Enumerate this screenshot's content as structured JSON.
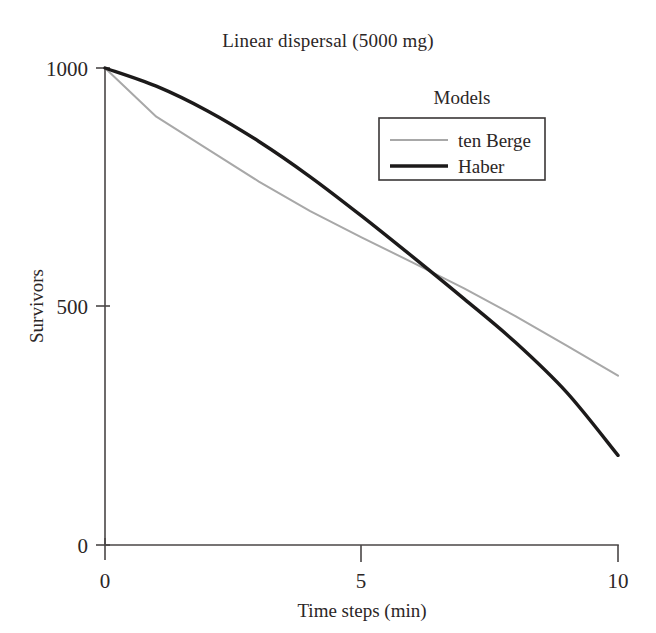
{
  "chart_data": {
    "type": "line",
    "title": "Linear dispersal (5000 mg)",
    "xlabel": "Time steps (min)",
    "ylabel": "Survivors",
    "xlim": [
      0,
      10
    ],
    "ylim": [
      0,
      1000
    ],
    "xticks": [
      0,
      5,
      10
    ],
    "xtick_labels": [
      "0",
      "5",
      "10"
    ],
    "yticks": [
      0,
      500,
      1000
    ],
    "ytick_labels": [
      "0",
      "500",
      "1000"
    ],
    "grid": false,
    "legend_title": "Models",
    "legend_position": "upper right inside",
    "x": [
      0,
      1,
      2,
      3,
      4,
      5,
      6,
      7,
      8,
      9,
      10
    ],
    "series": [
      {
        "name": "ten Berge",
        "color": "#a8a8a8",
        "line_width": 2,
        "values": [
          1000,
          898,
          830,
          762,
          700,
          645,
          592,
          538,
          480,
          418,
          355
        ]
      },
      {
        "name": "Haber",
        "color": "#1c1a1a",
        "line_width": 3.4,
        "values": [
          1000,
          962,
          910,
          846,
          772,
          690,
          604,
          516,
          425,
          320,
          188
        ]
      }
    ]
  },
  "axes": {
    "y_tick_1000": "1000",
    "y_tick_500": "500",
    "y_tick_0": "0",
    "x_tick_0": "0",
    "x_tick_5": "5",
    "x_tick_10": "10"
  },
  "legend": {
    "title": "Models",
    "entries": [
      {
        "label": "ten Berge",
        "color": "#a8a8a8"
      },
      {
        "label": "Haber",
        "color": "#1c1a1a"
      }
    ]
  }
}
